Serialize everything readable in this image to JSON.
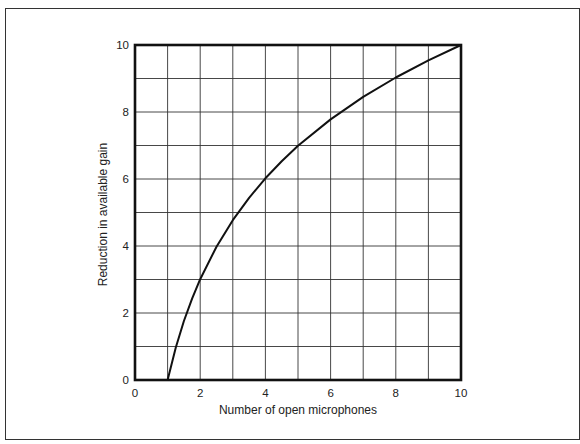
{
  "chart_data": {
    "type": "line",
    "title": "",
    "xlabel": "Number of open microphones",
    "ylabel": "Reduction in available gain",
    "xlim": [
      0,
      10
    ],
    "ylim": [
      0,
      10
    ],
    "x_ticks": [
      0,
      2,
      4,
      6,
      8,
      10
    ],
    "y_ticks": [
      0,
      2,
      4,
      6,
      8,
      10
    ],
    "x_tick_labels": [
      "0",
      "2",
      "4",
      "6",
      "8",
      "10"
    ],
    "y_tick_labels": [
      "0",
      "2",
      "4",
      "6",
      "8",
      "10"
    ],
    "grid": true,
    "grid_step": 1,
    "legend": "none",
    "series": [
      {
        "name": "Gain reduction",
        "x": [
          1,
          1.25,
          1.5,
          1.75,
          2,
          2.5,
          3,
          3.5,
          4,
          4.5,
          5,
          6,
          7,
          8,
          9,
          10
        ],
        "y": [
          0,
          0.97,
          1.76,
          2.43,
          3.01,
          3.98,
          4.77,
          5.44,
          6.02,
          6.53,
          6.99,
          7.78,
          8.45,
          9.03,
          9.54,
          10
        ]
      }
    ],
    "colors": {
      "line": "#111111",
      "grid": "#333333",
      "frame": "#111111"
    }
  }
}
